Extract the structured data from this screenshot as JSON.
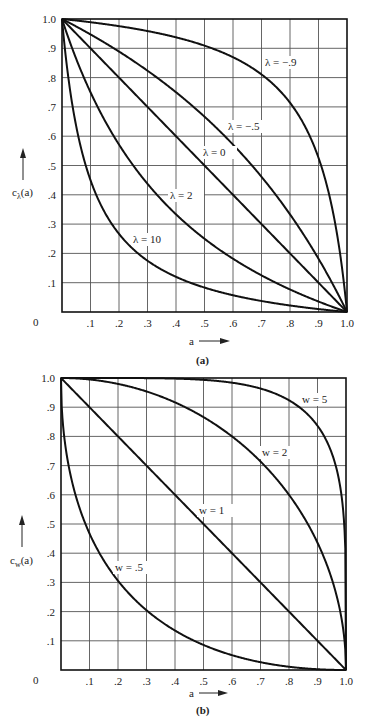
{
  "chart_data": [
    {
      "type": "line",
      "panel_caption": "(a)",
      "title": "",
      "xlabel": "a",
      "ylabel": "c_λ(a)",
      "xlim": [
        0,
        1.0
      ],
      "ylim": [
        0,
        1.0
      ],
      "grid": true,
      "x_ticks": [
        "0",
        ".1",
        ".2",
        ".3",
        ".4",
        ".5",
        ".6",
        ".7",
        ".8",
        ".9",
        "1.0"
      ],
      "y_ticks": [
        ".1",
        ".2",
        ".3",
        ".4",
        ".5",
        ".6",
        ".7",
        ".8",
        ".9",
        "1.0"
      ],
      "x": [
        0,
        0.1,
        0.2,
        0.3,
        0.4,
        0.5,
        0.6,
        0.7,
        0.8,
        0.9,
        1.0
      ],
      "series": [
        {
          "name": "λ = −.9",
          "param": -0.9,
          "label": "λ = −.9",
          "label_pos": [
            265,
            66
          ],
          "values": [
            1.0,
            0.989,
            0.976,
            0.959,
            0.938,
            0.909,
            0.87,
            0.814,
            0.714,
            0.526,
            0.0
          ]
        },
        {
          "name": "λ = −.5",
          "param": -0.5,
          "label": "λ = −.5",
          "label_pos": [
            228,
            130
          ],
          "values": [
            1.0,
            0.947,
            0.889,
            0.824,
            0.75,
            0.667,
            0.571,
            0.462,
            0.333,
            0.182,
            0.0
          ]
        },
        {
          "name": "λ = 0",
          "param": 0,
          "label": "λ = 0",
          "label_pos": [
            203,
            156
          ],
          "values": [
            1.0,
            0.9,
            0.8,
            0.7,
            0.6,
            0.5,
            0.4,
            0.3,
            0.2,
            0.1,
            0.0
          ]
        },
        {
          "name": "λ = 2",
          "param": 2,
          "label": "λ = 2",
          "label_pos": [
            170,
            199
          ],
          "values": [
            1.0,
            0.75,
            0.571,
            0.4375,
            0.333,
            0.25,
            0.182,
            0.125,
            0.077,
            0.036,
            0.0
          ]
        },
        {
          "name": "λ = 10",
          "param": 10,
          "label": "λ = 10",
          "label_pos": [
            133,
            243
          ],
          "values": [
            1.0,
            0.45,
            0.267,
            0.175,
            0.12,
            0.083,
            0.057,
            0.0375,
            0.022,
            0.01,
            0.0
          ]
        }
      ]
    },
    {
      "type": "line",
      "panel_caption": "(b)",
      "title": "",
      "xlabel": "a",
      "ylabel": "c_w(a)",
      "xlim": [
        0,
        1.0
      ],
      "ylim": [
        0,
        1.0
      ],
      "grid": true,
      "x_ticks": [
        "0",
        ".1",
        ".2",
        ".3",
        ".4",
        ".5",
        ".6",
        ".7",
        ".8",
        ".9",
        "1.0"
      ],
      "y_ticks": [
        ".1",
        ".2",
        ".3",
        ".4",
        ".5",
        ".6",
        ".7",
        ".8",
        ".9",
        "1.0"
      ],
      "x": [
        0,
        0.1,
        0.2,
        0.3,
        0.4,
        0.5,
        0.6,
        0.7,
        0.8,
        0.9,
        1.0
      ],
      "series": [
        {
          "name": "w = 5",
          "param": 5,
          "label": "w = 5",
          "label_pos": [
            302,
            403
          ],
          "values": [
            1.0,
            1.0,
            1.0,
            0.9995,
            0.998,
            0.994,
            0.984,
            0.963,
            0.917,
            0.808,
            0.0
          ]
        },
        {
          "name": "w = 2",
          "param": 2,
          "label": "w = 2",
          "label_pos": [
            262,
            456
          ],
          "values": [
            1.0,
            0.995,
            0.98,
            0.954,
            0.917,
            0.866,
            0.8,
            0.714,
            0.6,
            0.436,
            0.0
          ]
        },
        {
          "name": "w = 1",
          "param": 1,
          "label": "w = 1",
          "label_pos": [
            199,
            514
          ],
          "values": [
            1.0,
            0.9,
            0.8,
            0.7,
            0.6,
            0.5,
            0.4,
            0.3,
            0.2,
            0.1,
            0.0
          ]
        },
        {
          "name": "w = .5",
          "param": 0.5,
          "label": "w = .5",
          "label_pos": [
            115,
            571
          ],
          "values": [
            1.0,
            0.468,
            0.306,
            0.205,
            0.135,
            0.086,
            0.051,
            0.027,
            0.011,
            0.003,
            0.0
          ]
        }
      ]
    }
  ],
  "panels": {
    "a": {
      "caption": "(a)",
      "ylabel_main": "c",
      "ylabel_sub": "λ",
      "ylabel_arg": "(a)",
      "xlabel": "a",
      "origin": "0",
      "labels": [
        "λ = −.9",
        "λ = −.5",
        "λ = 0",
        "λ = 2",
        "λ = 10"
      ]
    },
    "b": {
      "caption": "(b)",
      "ylabel_main": "c",
      "ylabel_sub": "w",
      "ylabel_arg": "(a)",
      "xlabel": "a",
      "origin": "0",
      "labels": [
        "w = 5",
        "w = 2",
        "w = 1",
        "w = .5"
      ]
    }
  }
}
